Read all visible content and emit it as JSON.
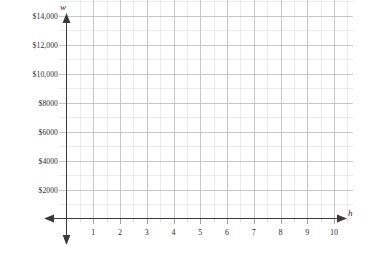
{
  "chart_data": {
    "type": "scatter",
    "title": "",
    "subtitle": "",
    "xlabel": "h",
    "ylabel": "w",
    "grid": true,
    "legend": false,
    "series": [],
    "x": [],
    "values": [],
    "xlim": [
      0,
      10.7
    ],
    "ylim": [
      0,
      15000
    ],
    "x_ticks": [
      1,
      2,
      3,
      4,
      5,
      6,
      7,
      8,
      9,
      10
    ],
    "x_tick_labels": [
      "1",
      "2",
      "3",
      "4",
      "5",
      "6",
      "7",
      "8",
      "9",
      "10"
    ],
    "x_minor_tick_step": 0.5,
    "y_ticks": [
      2000,
      4000,
      6000,
      8000,
      10000,
      12000,
      14000
    ],
    "y_tick_labels": [
      "$2000",
      "$4000",
      "$6000",
      "$8000",
      "$10,000",
      "$12,000",
      "$14,000"
    ],
    "y_minor_tick_step": 1000,
    "annotations": []
  },
  "axes": {
    "y_variable": "w",
    "x_variable": "h"
  },
  "colors": {
    "background": "#ffffff",
    "grid_major": "#b9b9bd",
    "grid_minor": "#dedee2",
    "axis_line": "#3a3a3a",
    "tick_text": "#2b2b2b",
    "axis_label_text": "#1f1f1f"
  }
}
